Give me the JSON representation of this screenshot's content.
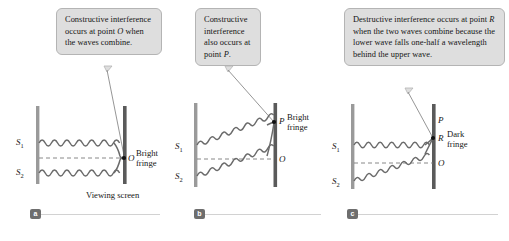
{
  "figure": {
    "panels": [
      {
        "id": "a",
        "badge": "a",
        "caption": "Constructive interference occurs at point O when the waves combine.",
        "caption_parts": [
          {
            "text": "Constructive interference occurs at point ",
            "italic": false
          },
          {
            "text": "O",
            "italic": true
          },
          {
            "text": " when the waves combine.",
            "italic": false
          }
        ],
        "source_labels": [
          "S",
          "S"
        ],
        "source_subscripts": [
          "1",
          "2"
        ],
        "point_labels": [
          "O"
        ],
        "fringe_label": "Bright fringe",
        "screen_label": "Viewing screen"
      },
      {
        "id": "b",
        "badge": "b",
        "caption": "Constructive interference also occurs at point P.",
        "caption_parts": [
          {
            "text": "Constructive interference also occurs at point ",
            "italic": false
          },
          {
            "text": "P",
            "italic": true
          },
          {
            "text": ".",
            "italic": false
          }
        ],
        "source_labels": [
          "S",
          "S"
        ],
        "source_subscripts": [
          "1",
          "2"
        ],
        "point_labels": [
          "P",
          "O"
        ],
        "fringe_label": "Bright fringe",
        "screen_label": ""
      },
      {
        "id": "c",
        "badge": "c",
        "caption": "Destructive interference occurs at point R when the two waves combine because the lower wave falls one-half a wavelength behind the upper wave.",
        "caption_parts": [
          {
            "text": "Destructive interference occurs at point ",
            "italic": false
          },
          {
            "text": "R",
            "italic": true
          },
          {
            "text": " when the two waves combine because the lower wave falls one-half a wavelength behind the upper wave.",
            "italic": false
          }
        ],
        "source_labels": [
          "S",
          "S"
        ],
        "source_subscripts": [
          "1",
          "2"
        ],
        "point_labels": [
          "P",
          "R",
          "O"
        ],
        "fringe_label": "Dark fringe",
        "screen_label": ""
      }
    ],
    "colors": {
      "callout_fill": "#dedede",
      "callout_border": "#b4b4b4",
      "barrier": "#9a9a9a",
      "screen": "#5a5a5a",
      "wave": "#6b6b6b",
      "axis_dash": "#7a7a7a",
      "point_dot": "#111111",
      "badge_fill": "#6e6e6e",
      "rule": "#d2d2d2"
    }
  }
}
